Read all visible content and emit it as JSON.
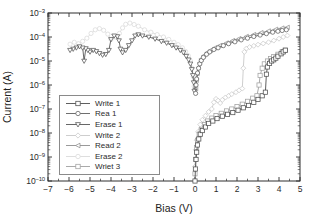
{
  "chart_data": {
    "type": "line",
    "title": "",
    "xlabel": "Bias (V)",
    "ylabel": "Current (A)",
    "xlim": [
      -7,
      5
    ],
    "x_ticks": [
      -7,
      -6,
      -5,
      -4,
      -3,
      -2,
      -1,
      0,
      1,
      2,
      3,
      4,
      5
    ],
    "y_scale": "log",
    "y_tick_exponents": [
      -3,
      -4,
      -5,
      -6,
      -7,
      -8,
      -9,
      -10
    ],
    "ylim_log": [
      -3,
      -10
    ],
    "grid": false,
    "legend_position": "left-middle",
    "axis_color": "#2e2e2e",
    "series": [
      {
        "name": "erase2",
        "label": "Erase 2",
        "marker": "circle",
        "color": "#dadada",
        "points": [
          [
            -0.04,
            -6.05
          ],
          [
            -0.08,
            -5.65
          ],
          [
            -0.14,
            -5.3
          ],
          [
            -0.22,
            -5.0
          ],
          [
            -0.32,
            -4.78
          ],
          [
            -0.45,
            -4.6
          ],
          [
            -0.6,
            -4.45
          ],
          [
            -0.8,
            -4.32
          ],
          [
            -1.0,
            -4.22
          ],
          [
            -1.25,
            -4.1
          ],
          [
            -1.5,
            -4.0
          ],
          [
            -1.8,
            -3.9
          ],
          [
            -2.1,
            -3.8
          ],
          [
            -2.4,
            -3.7
          ],
          [
            -2.7,
            -3.55
          ],
          [
            -2.9,
            -3.48
          ],
          [
            -3.1,
            -3.42
          ],
          [
            -3.3,
            -3.47
          ],
          [
            -3.45,
            -3.62
          ],
          [
            -3.6,
            -3.85
          ],
          [
            -3.8,
            -4.0
          ],
          [
            -4.0,
            -4.1
          ],
          [
            -4.15,
            -3.88
          ],
          [
            -4.35,
            -3.72
          ],
          [
            -4.55,
            -3.65
          ],
          [
            -4.75,
            -3.7
          ],
          [
            -4.95,
            -3.85
          ],
          [
            -5.15,
            -4.05
          ],
          [
            -5.35,
            -4.18
          ],
          [
            -5.55,
            -4.28
          ],
          [
            -5.75,
            -4.22
          ],
          [
            -5.95,
            -4.3
          ]
        ]
      },
      {
        "name": "write2",
        "label": "Write 2",
        "marker": "diamond",
        "color": "#c8c8c8",
        "points": [
          [
            0,
            -9.4
          ],
          [
            0.04,
            -8.7
          ],
          [
            0.08,
            -8.3
          ],
          [
            0.15,
            -7.95
          ],
          [
            0.25,
            -7.65
          ],
          [
            0.35,
            -7.45
          ],
          [
            0.5,
            -7.28
          ],
          [
            0.65,
            -7.12
          ],
          [
            0.8,
            -7.0
          ],
          [
            0.9,
            -6.72
          ],
          [
            1.0,
            -6.58
          ],
          [
            1.1,
            -6.65
          ],
          [
            1.2,
            -6.75
          ],
          [
            1.3,
            -6.62
          ],
          [
            1.45,
            -6.52
          ],
          [
            1.6,
            -6.45
          ],
          [
            1.75,
            -6.38
          ],
          [
            1.95,
            -6.3
          ],
          [
            2.1,
            -6.22
          ],
          [
            2.25,
            -6.15
          ],
          [
            2.3,
            -5.3
          ],
          [
            2.35,
            -4.62
          ],
          [
            2.45,
            -4.48
          ],
          [
            2.6,
            -4.42
          ],
          [
            2.8,
            -4.37
          ],
          [
            3.0,
            -4.32
          ],
          [
            3.25,
            -4.27
          ],
          [
            3.5,
            -4.22
          ],
          [
            3.75,
            -4.15
          ],
          [
            4.0,
            -4.07
          ],
          [
            4.2,
            -4.0
          ],
          [
            4.4,
            -3.94
          ]
        ]
      },
      {
        "name": "wriet3",
        "label": "Wriet 3",
        "marker": "square",
        "color": "#a0a0a0",
        "points": [
          [
            0,
            -9.7
          ],
          [
            0.03,
            -9.1
          ],
          [
            0.07,
            -8.6
          ],
          [
            0.12,
            -8.3
          ],
          [
            0.2,
            -8.05
          ],
          [
            0.3,
            -7.85
          ],
          [
            0.45,
            -7.65
          ],
          [
            0.6,
            -7.5
          ],
          [
            0.8,
            -7.38
          ],
          [
            1.0,
            -7.28
          ],
          [
            1.25,
            -7.18
          ],
          [
            1.5,
            -7.08
          ],
          [
            1.75,
            -7.0
          ],
          [
            2.0,
            -6.9
          ],
          [
            2.25,
            -6.8
          ],
          [
            2.5,
            -6.68
          ],
          [
            2.75,
            -6.55
          ],
          [
            2.95,
            -6.45
          ],
          [
            3.05,
            -6.0
          ],
          [
            3.1,
            -5.6
          ],
          [
            3.2,
            -5.3
          ],
          [
            3.3,
            -5.12
          ],
          [
            3.45,
            -5.0
          ],
          [
            3.6,
            -4.9
          ],
          [
            3.75,
            -4.82
          ],
          [
            3.95,
            -4.72
          ],
          [
            4.15,
            -4.62
          ],
          [
            4.3,
            -4.55
          ]
        ]
      },
      {
        "name": "read2",
        "label": "Read 2",
        "marker": "triangle-left",
        "color": "#8f8f8f",
        "points": [
          [
            0.04,
            -6.15
          ],
          [
            0.07,
            -5.8
          ],
          [
            0.11,
            -5.52
          ],
          [
            0.16,
            -5.28
          ],
          [
            0.22,
            -5.08
          ],
          [
            0.3,
            -4.92
          ],
          [
            0.42,
            -4.78
          ],
          [
            0.58,
            -4.65
          ],
          [
            0.75,
            -4.55
          ],
          [
            0.95,
            -4.45
          ],
          [
            1.2,
            -4.35
          ],
          [
            1.5,
            -4.25
          ],
          [
            1.8,
            -4.15
          ],
          [
            2.1,
            -4.07
          ],
          [
            2.45,
            -3.98
          ],
          [
            2.8,
            -3.9
          ],
          [
            3.15,
            -3.82
          ],
          [
            3.5,
            -3.75
          ],
          [
            3.85,
            -3.68
          ],
          [
            4.15,
            -3.63
          ],
          [
            4.4,
            -3.6
          ]
        ]
      },
      {
        "name": "erase1",
        "label": "Erase 1",
        "marker": "triangle-down",
        "color": "#565656",
        "points": [
          [
            -0.03,
            -6.25
          ],
          [
            -0.06,
            -5.9
          ],
          [
            -0.1,
            -5.6
          ],
          [
            -0.15,
            -5.35
          ],
          [
            -0.22,
            -5.12
          ],
          [
            -0.3,
            -4.95
          ],
          [
            -0.42,
            -4.8
          ],
          [
            -0.55,
            -4.65
          ],
          [
            -0.7,
            -4.55
          ],
          [
            -0.9,
            -4.45
          ],
          [
            -1.1,
            -4.35
          ],
          [
            -1.35,
            -4.25
          ],
          [
            -1.6,
            -4.18
          ],
          [
            -1.9,
            -4.08
          ],
          [
            -2.2,
            -4.0
          ],
          [
            -2.5,
            -3.95
          ],
          [
            -2.7,
            -3.9
          ],
          [
            -2.85,
            -3.95
          ],
          [
            -3.0,
            -4.15
          ],
          [
            -3.15,
            -4.35
          ],
          [
            -3.3,
            -4.55
          ],
          [
            -3.45,
            -4.65
          ],
          [
            -3.55,
            -4.5
          ],
          [
            -3.62,
            -4.15
          ],
          [
            -3.7,
            -3.98
          ],
          [
            -3.85,
            -3.95
          ],
          [
            -4.0,
            -4.1
          ],
          [
            -4.1,
            -4.55
          ],
          [
            -4.25,
            -4.72
          ],
          [
            -4.4,
            -4.75
          ],
          [
            -4.55,
            -4.68
          ],
          [
            -4.7,
            -4.6
          ],
          [
            -4.85,
            -4.55
          ],
          [
            -5.0,
            -4.62
          ],
          [
            -5.1,
            -4.55
          ],
          [
            -5.2,
            -4.48
          ],
          [
            -5.28,
            -5.0
          ],
          [
            -5.35,
            -4.45
          ],
          [
            -5.5,
            -4.4
          ],
          [
            -5.65,
            -4.45
          ],
          [
            -5.8,
            -4.5
          ],
          [
            -5.95,
            -4.55
          ]
        ]
      },
      {
        "name": "rea1",
        "label": "Rea 1",
        "marker": "circle",
        "color": "#5f5f5f",
        "points": [
          [
            0.03,
            -6.35
          ],
          [
            0.05,
            -6.0
          ],
          [
            0.08,
            -5.75
          ],
          [
            0.12,
            -5.5
          ],
          [
            0.17,
            -5.3
          ],
          [
            0.23,
            -5.12
          ],
          [
            0.3,
            -4.98
          ],
          [
            0.4,
            -4.85
          ],
          [
            0.55,
            -4.72
          ],
          [
            0.7,
            -4.62
          ],
          [
            0.9,
            -4.52
          ],
          [
            1.1,
            -4.45
          ],
          [
            1.35,
            -4.36
          ],
          [
            1.6,
            -4.28
          ],
          [
            1.9,
            -4.2
          ],
          [
            2.2,
            -4.12
          ],
          [
            2.5,
            -4.05
          ],
          [
            2.8,
            -3.98
          ],
          [
            3.1,
            -3.92
          ],
          [
            3.4,
            -3.86
          ],
          [
            3.7,
            -3.8
          ],
          [
            3.95,
            -3.76
          ],
          [
            4.15,
            -3.73
          ],
          [
            4.35,
            -3.7
          ]
        ]
      },
      {
        "name": "write1",
        "label": "Write 1",
        "marker": "square",
        "color": "#4d4d4d",
        "points": [
          [
            0,
            -10
          ],
          [
            0.02,
            -9.5
          ],
          [
            0.05,
            -9.1
          ],
          [
            0.08,
            -8.8
          ],
          [
            0.12,
            -8.5
          ],
          [
            0.18,
            -8.25
          ],
          [
            0.25,
            -8.05
          ],
          [
            0.35,
            -7.9
          ],
          [
            0.5,
            -7.75
          ],
          [
            0.65,
            -7.6
          ],
          [
            0.85,
            -7.5
          ],
          [
            1.05,
            -7.4
          ],
          [
            1.3,
            -7.3
          ],
          [
            1.55,
            -7.22
          ],
          [
            1.8,
            -7.15
          ],
          [
            2.05,
            -7.05
          ],
          [
            2.3,
            -6.95
          ],
          [
            2.55,
            -6.85
          ],
          [
            2.8,
            -6.72
          ],
          [
            3.0,
            -6.6
          ],
          [
            3.2,
            -6.45
          ],
          [
            3.35,
            -6.3
          ],
          [
            3.4,
            -5.55
          ],
          [
            3.45,
            -5.25
          ],
          [
            3.55,
            -5.1
          ],
          [
            3.65,
            -5.0
          ],
          [
            3.75,
            -4.95
          ],
          [
            3.85,
            -4.88
          ],
          [
            3.95,
            -4.8
          ],
          [
            4.1,
            -4.7
          ],
          [
            4.2,
            -4.62
          ],
          [
            4.3,
            -4.55
          ]
        ]
      }
    ],
    "legend_order": [
      "write1",
      "rea1",
      "erase1",
      "write2",
      "read2",
      "erase2",
      "wriet3"
    ]
  }
}
